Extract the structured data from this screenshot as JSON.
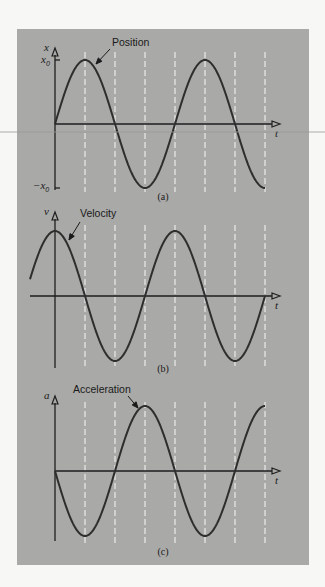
{
  "figure": {
    "panel": {
      "x": 17,
      "y": 29,
      "width": 292,
      "height": 536,
      "color": "#a9a9a7"
    },
    "scanline_y": 132
  },
  "chart_data": [
    {
      "type": "line",
      "id": "a",
      "caption": "(a)",
      "title": "Position",
      "ylabel": "x",
      "xlabel": "t",
      "ytick_labels": [
        "x0",
        "−x0"
      ],
      "function": "x0*sin(omega*t)",
      "amplitude_label": "x0",
      "x_start_phase_px": 0,
      "plot": {
        "origin_x": 55,
        "zero_y": 124,
        "amp_px": 64,
        "period_px": 120,
        "curve_start_x": 55,
        "curve_end_x": 265,
        "axis_end_x": 280,
        "axis_top_y": 48,
        "axis_bottom_y": 190,
        "axis_left_x": 55
      },
      "dashed_lines_x": [
        85,
        115,
        145,
        175,
        205,
        235,
        265
      ],
      "dash_top_y": 52,
      "dash_bottom_y": 192,
      "phase": 0,
      "sign": 1,
      "annotation": {
        "text": "Position",
        "text_x": 112,
        "text_y": 46,
        "arrow_from": [
          110,
          49
        ],
        "arrow_to": [
          96,
          64
        ]
      },
      "caption_pos": [
        163,
        200
      ],
      "values_at_quarter_periods": [
        0,
        1,
        0,
        -1,
        0,
        1,
        0,
        -1
      ]
    },
    {
      "type": "line",
      "id": "b",
      "caption": "(b)",
      "title": "Velocity",
      "ylabel": "v",
      "xlabel": "t",
      "function": "v0*cos(omega*t)",
      "plot": {
        "origin_x": 55,
        "zero_y": 296,
        "amp_px": 65,
        "period_px": 120,
        "curve_start_x": 30,
        "curve_end_x": 265,
        "axis_end_x": 280,
        "axis_top_y": 212,
        "axis_bottom_y": 368,
        "axis_left_x": 30
      },
      "dashed_lines_x": [
        85,
        115,
        145,
        175,
        205,
        235,
        265
      ],
      "dash_top_y": 225,
      "dash_bottom_y": 368,
      "phase": 0.25,
      "sign": 1,
      "annotation": {
        "text": "Velocity",
        "text_x": 80,
        "text_y": 217,
        "arrow_from": [
          80,
          222
        ],
        "arrow_to": [
          69,
          240
        ]
      },
      "caption_pos": [
        163,
        372
      ],
      "values_at_quarter_periods": [
        1,
        0,
        -1,
        0,
        1,
        0,
        -1,
        0
      ]
    },
    {
      "type": "line",
      "id": "c",
      "caption": "(c)",
      "title": "Acceleration",
      "ylabel": "a",
      "xlabel": "t",
      "function": "-a0*sin(omega*t)",
      "plot": {
        "origin_x": 55,
        "zero_y": 471,
        "amp_px": 65,
        "period_px": 120,
        "curve_start_x": 55,
        "curve_end_x": 265,
        "axis_end_x": 280,
        "axis_top_y": 396,
        "axis_bottom_y": 541,
        "axis_left_x": 55
      },
      "dashed_lines_x": [
        85,
        115,
        145,
        175,
        205,
        235,
        265
      ],
      "dash_top_y": 402,
      "dash_bottom_y": 544,
      "phase": 0,
      "sign": -1,
      "annotation": {
        "text": "Acceleration",
        "text_x": 73,
        "text_y": 393,
        "arrow_from": [
          128,
          396
        ],
        "arrow_to": [
          138,
          408
        ]
      },
      "caption_pos": [
        163,
        555
      ],
      "values_at_quarter_periods": [
        0,
        -1,
        0,
        1,
        0,
        -1,
        0,
        1
      ]
    }
  ]
}
